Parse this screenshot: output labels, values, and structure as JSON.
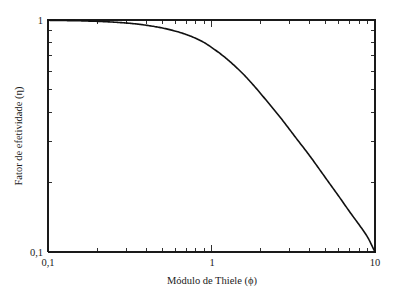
{
  "chart_data": {
    "type": "line",
    "title": "",
    "xlabel": "Módulo de Thiele (ϕ)",
    "ylabel": "Fator de efetividade (η)",
    "xscale": "log",
    "yscale": "log",
    "xlim": [
      0.1,
      10
    ],
    "ylim": [
      0.1,
      1
    ],
    "grid": false,
    "legend": null,
    "xticklabels": [
      "0,1",
      "1",
      "10"
    ],
    "xtickvalues": [
      0.1,
      1,
      10
    ],
    "yticklabels": [
      "0,1",
      "1"
    ],
    "ytickvalues": [
      0.1,
      1
    ],
    "line_color": "#111111",
    "background_color": "#ffffff",
    "series": [
      {
        "name": "Fator de efetividade",
        "x": [
          0.1,
          0.12,
          0.15,
          0.18,
          0.22,
          0.27,
          0.33,
          0.4,
          0.5,
          0.6,
          0.7,
          0.8,
          0.9,
          1.0,
          1.2,
          1.5,
          1.8,
          2.2,
          2.7,
          3.3,
          4.0,
          5.0,
          6.0,
          7.0,
          8.0,
          9.0,
          10.0
        ],
        "y": [
          0.997,
          0.995,
          0.993,
          0.989,
          0.984,
          0.976,
          0.965,
          0.949,
          0.924,
          0.896,
          0.866,
          0.834,
          0.8,
          0.762,
          0.693,
          0.602,
          0.525,
          0.444,
          0.372,
          0.309,
          0.259,
          0.208,
          0.174,
          0.149,
          0.131,
          0.116,
          0.1
        ]
      }
    ]
  },
  "axes": {
    "x_title": "Módulo de Thiele (ϕ)",
    "y_title": "Fator de efetividade (η)",
    "x_labels": [
      {
        "text": "0,1",
        "value": 0.1
      },
      {
        "text": "1",
        "value": 1
      },
      {
        "text": "10",
        "value": 10
      }
    ],
    "y_labels": [
      {
        "text": "1",
        "value": 1
      },
      {
        "text": "0,1",
        "value": 0.1
      }
    ]
  }
}
